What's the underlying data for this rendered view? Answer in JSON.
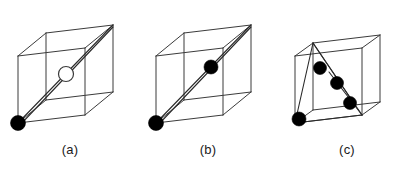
{
  "figure": {
    "background_color": "#ffffff",
    "edge_color": "#3b3b3b",
    "path_color": "#2a2a2a",
    "atom_fill_color": "#000000",
    "atom_open_fill_color": "#ffffff",
    "panels": [
      {
        "id": "a",
        "caption": "(a)",
        "description": "cube with body diagonal, filled atom at front-bottom-left corner and open atom at body center",
        "cube": {
          "front_bottom_left": [
            18,
            123
          ],
          "front_bottom_right": [
            85,
            115
          ],
          "front_top_right": [
            85,
            48
          ],
          "front_top_left": [
            18,
            56
          ],
          "back_bottom_left": [
            46,
            100
          ],
          "back_bottom_right": [
            113,
            92
          ],
          "back_top_right": [
            113,
            25
          ],
          "back_top_left": [
            46,
            33
          ]
        },
        "paths": [
          {
            "name": "body-diagonal",
            "from": [
              18,
              123
            ],
            "to": [
              113,
              25
            ]
          }
        ],
        "atoms": [
          {
            "type": "filled",
            "cx": 18,
            "cy": 123,
            "r": 7.5,
            "site": "corner"
          },
          {
            "type": "open",
            "cx": 66,
            "cy": 74,
            "r": 7.5,
            "site": "body-center"
          }
        ]
      },
      {
        "id": "b",
        "caption": "(b)",
        "description": "cube with body diagonal, filled atom at front-bottom-left corner and filled atom at body center",
        "cube": {
          "front_bottom_left": [
            18,
            123
          ],
          "front_bottom_right": [
            85,
            115
          ],
          "front_top_right": [
            85,
            48
          ],
          "front_top_left": [
            18,
            56
          ],
          "back_bottom_left": [
            46,
            100
          ],
          "back_bottom_right": [
            113,
            92
          ],
          "back_top_right": [
            113,
            25
          ],
          "back_top_left": [
            46,
            33
          ]
        },
        "paths": [
          {
            "name": "body-diagonal",
            "from": [
              18,
              123
            ],
            "to": [
              113,
              25
            ]
          }
        ],
        "atoms": [
          {
            "type": "filled",
            "cx": 18,
            "cy": 123,
            "r": 7.5,
            "site": "corner"
          },
          {
            "type": "filled",
            "cx": 73,
            "cy": 67,
            "r": 7.0,
            "site": "body-center"
          }
        ]
      },
      {
        "id": "c",
        "caption": "(c)",
        "description": "cube with fan of jump paths from back-top-left and back-bottom-right vertices, four filled atoms along the paths",
        "cube": {
          "front_bottom_left": [
            18,
            123
          ],
          "front_bottom_right": [
            85,
            115
          ],
          "front_top_right": [
            85,
            48
          ],
          "front_top_left": [
            18,
            56
          ],
          "back_bottom_left": [
            46,
            100
          ],
          "back_bottom_right": [
            113,
            92
          ],
          "back_top_right": [
            113,
            25
          ],
          "back_top_left": [
            46,
            33
          ]
        },
        "paths": [
          {
            "name": "jump-1",
            "from": [
              36,
              43
            ],
            "to": [
              18,
              123
            ]
          },
          {
            "name": "jump-2",
            "from": [
              36,
              43
            ],
            "to": [
              85,
              115
            ]
          },
          {
            "name": "jump-3",
            "from": [
              36,
              43
            ],
            "to": [
              78,
              105
            ]
          },
          {
            "name": "jump-4",
            "from": [
              18,
              123
            ],
            "to": [
              85,
              115
            ]
          },
          {
            "name": "jump-5",
            "from": [
              85,
              115
            ],
            "to": [
              52,
              72
            ]
          }
        ],
        "atoms": [
          {
            "type": "filled",
            "cx": 43,
            "cy": 68,
            "r": 6.5,
            "site": "path"
          },
          {
            "type": "filled",
            "cx": 60,
            "cy": 83,
            "r": 6.5,
            "site": "path"
          },
          {
            "type": "filled",
            "cx": 73,
            "cy": 103,
            "r": 6.5,
            "site": "path"
          },
          {
            "type": "filled",
            "cx": 22,
            "cy": 119,
            "r": 7.0,
            "site": "corner"
          }
        ]
      }
    ]
  }
}
